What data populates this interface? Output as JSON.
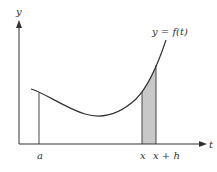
{
  "diagram": {
    "type": "function-area-under-curve",
    "axes": {
      "y_label": "y",
      "x_label": "t"
    },
    "curve_label": "y = f(t)",
    "tick_labels": [
      "a",
      "x",
      "x + h"
    ],
    "shaded_region": {
      "from": "x",
      "to": "x + h",
      "fill": "#c8c8c8"
    },
    "colors": {
      "line": "#333333",
      "background": "#ffffff"
    }
  }
}
